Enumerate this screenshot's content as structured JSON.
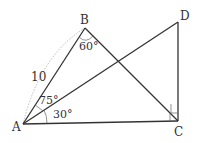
{
  "diagram": {
    "points": {
      "A": {
        "label": "A"
      },
      "B": {
        "label": "B"
      },
      "C": {
        "label": "C"
      },
      "D": {
        "label": "D"
      }
    },
    "segments": [
      "AB",
      "AD",
      "AC",
      "BC",
      "DC"
    ],
    "annotations": {
      "side_AB": "10",
      "angle_B": "60°",
      "angle_BAC": "75°",
      "angle_DAC": "30°",
      "right_angle_at": "C"
    }
  }
}
